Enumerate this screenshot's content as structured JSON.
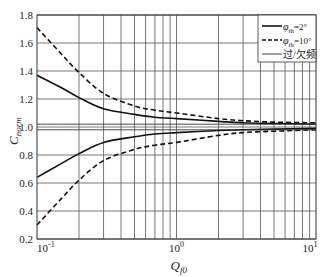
{
  "chart_data": {
    "type": "line",
    "title": "",
    "xlabel": "Q_f0",
    "xlabel_main": "Q",
    "xlabel_sub": "f0",
    "ylabel": "C_norm",
    "ylabel_main": "C",
    "ylabel_sub": "norm",
    "xscale": "log",
    "xlim": [
      0.1,
      10
    ],
    "ylim": [
      0.2,
      1.8
    ],
    "grid": true,
    "x_ticks": [
      {
        "value": 0.1,
        "base": "10",
        "exp": "-1"
      },
      {
        "value": 1,
        "base": "10",
        "exp": "0"
      },
      {
        "value": 10,
        "base": "10",
        "exp": "1"
      }
    ],
    "y_ticks": [
      "0.2",
      "0.4",
      "0.6",
      "0.8",
      "1.0",
      "1.2",
      "1.4",
      "1.6",
      "1.8"
    ],
    "y_tick_values": [
      0.2,
      0.4,
      0.6,
      0.8,
      1.0,
      1.2,
      1.4,
      1.6,
      1.8
    ],
    "legend_position": "upper right",
    "series": [
      {
        "name": "φth=2° (upper)",
        "legend": "φth=2°",
        "style": "solid",
        "x": [
          0.1,
          0.15,
          0.2,
          0.3,
          0.5,
          0.7,
          1,
          2,
          3,
          5,
          10
        ],
        "y": [
          1.37,
          1.28,
          1.21,
          1.13,
          1.09,
          1.07,
          1.06,
          1.04,
          1.03,
          1.025,
          1.02
        ]
      },
      {
        "name": "φth=2° (lower)",
        "legend": "",
        "style": "solid",
        "x": [
          0.1,
          0.15,
          0.2,
          0.3,
          0.5,
          0.7,
          1,
          2,
          3,
          5,
          10
        ],
        "y": [
          0.64,
          0.74,
          0.81,
          0.89,
          0.93,
          0.95,
          0.96,
          0.975,
          0.98,
          0.985,
          0.99
        ]
      },
      {
        "name": "φth=10° (upper)",
        "legend": "φth=10°",
        "style": "dashed",
        "x": [
          0.1,
          0.15,
          0.2,
          0.3,
          0.5,
          0.7,
          1,
          2,
          3,
          5,
          10
        ],
        "y": [
          1.71,
          1.52,
          1.39,
          1.24,
          1.15,
          1.12,
          1.1,
          1.06,
          1.045,
          1.035,
          1.03
        ]
      },
      {
        "name": "φth=10° (lower)",
        "legend": "",
        "style": "dashed",
        "x": [
          0.1,
          0.15,
          0.2,
          0.3,
          0.5,
          0.7,
          1,
          2,
          3,
          5,
          10
        ],
        "y": [
          0.3,
          0.49,
          0.62,
          0.76,
          0.84,
          0.87,
          0.89,
          0.94,
          0.96,
          0.97,
          0.98
        ]
      },
      {
        "name": "过/欠频 upper limit",
        "legend": "过/欠频",
        "style": "thin",
        "x": [
          0.1,
          10
        ],
        "y": [
          1.02,
          1.02
        ]
      },
      {
        "name": "过/欠频 lower limit",
        "legend": "",
        "style": "thin",
        "x": [
          0.1,
          10
        ],
        "y": [
          0.98,
          0.98
        ]
      }
    ]
  },
  "legend": {
    "items": [
      {
        "main": "φ",
        "sub": "th",
        "suffix": "=2°",
        "style": "solid"
      },
      {
        "main": "φ",
        "sub": "th",
        "suffix": "=10°",
        "style": "dashed"
      },
      {
        "main": "",
        "sub": "",
        "suffix": "过/欠频",
        "style": "thin"
      }
    ]
  }
}
